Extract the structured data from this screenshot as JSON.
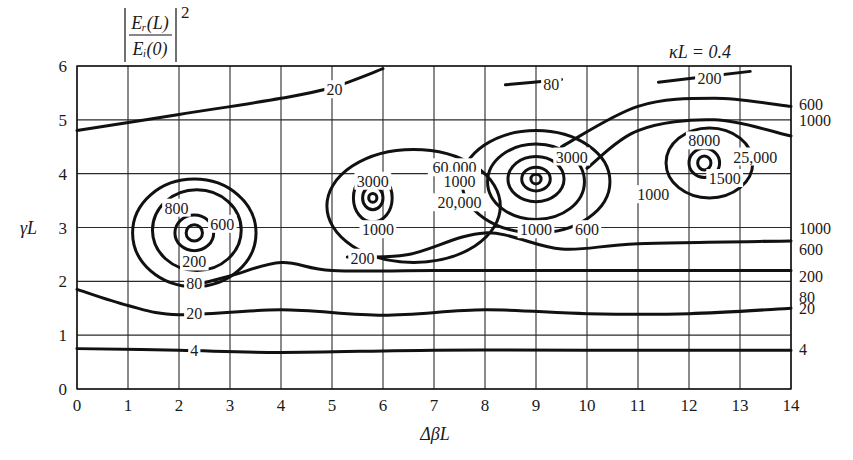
{
  "chart_data": {
    "type": "contour",
    "subtitle": "κL = 0.4",
    "xlabel": "ΔβL",
    "ylabel": "γL",
    "xlim": [
      0,
      14
    ],
    "ylim": [
      0,
      6
    ],
    "xticks": [
      0,
      1,
      2,
      3,
      4,
      5,
      6,
      7,
      8,
      9,
      10,
      11,
      12,
      13,
      14
    ],
    "yticks": [
      0,
      1,
      2,
      3,
      4,
      5,
      6
    ],
    "grid": true,
    "contour_levels": [
      4,
      20,
      80,
      200,
      600,
      800,
      1000,
      1500,
      3000,
      8000,
      20000,
      25000,
      60000
    ],
    "peaks": [
      {
        "x": 2.3,
        "y": 2.9,
        "labels": [
          "800",
          "600",
          "200",
          "80"
        ]
      },
      {
        "x": 5.8,
        "y": 3.55,
        "labels": [
          "3000",
          "1000",
          "20,000"
        ]
      },
      {
        "x": 9.0,
        "y": 3.9,
        "labels": [
          "60,000",
          "1000",
          "3000",
          "1000",
          "600"
        ]
      },
      {
        "x": 12.3,
        "y": 4.2,
        "labels": [
          "8000",
          "25,000",
          "1500",
          "1000"
        ]
      }
    ],
    "right_edge_labels": [
      {
        "value": "600",
        "y": 5.3
      },
      {
        "value": "1000",
        "y": 5.0
      },
      {
        "value": "1000",
        "y": 3.0
      },
      {
        "value": "600",
        "y": 2.6
      },
      {
        "value": "200",
        "y": 2.1
      },
      {
        "value": "80",
        "y": 1.7
      },
      {
        "value": "20",
        "y": 1.5
      },
      {
        "value": "4",
        "y": 0.75
      }
    ],
    "contours": [
      {
        "level": "4",
        "points": [
          [
            0,
            0.75
          ],
          [
            2,
            0.72
          ],
          [
            4,
            0.68
          ],
          [
            7,
            0.72
          ],
          [
            10,
            0.72
          ],
          [
            14,
            0.72
          ]
        ]
      },
      {
        "level": "20",
        "points": [
          [
            0,
            1.85
          ],
          [
            1,
            1.55
          ],
          [
            2,
            1.38
          ],
          [
            4,
            1.47
          ],
          [
            6,
            1.37
          ],
          [
            8,
            1.47
          ],
          [
            10,
            1.4
          ],
          [
            12,
            1.4
          ],
          [
            14,
            1.5
          ]
        ]
      },
      {
        "level": "80",
        "points": [
          [
            2.2,
            1.9
          ],
          [
            3,
            2.1
          ],
          [
            4,
            2.35
          ],
          [
            5,
            2.2
          ],
          [
            7,
            2.2
          ],
          [
            10,
            2.2
          ],
          [
            14,
            2.2
          ]
        ]
      },
      {
        "level": "200",
        "points": [
          [
            5.3,
            2.45
          ],
          [
            6.5,
            2.5
          ],
          [
            8,
            2.9
          ],
          [
            9.5,
            2.6
          ],
          [
            11,
            2.7
          ],
          [
            14,
            2.75
          ]
        ]
      },
      {
        "level": "20 (top)",
        "points": [
          [
            0,
            4.8
          ],
          [
            2,
            5.1
          ],
          [
            4,
            5.4
          ],
          [
            5,
            5.6
          ],
          [
            6,
            5.95
          ]
        ]
      },
      {
        "level": "80 (top)",
        "points": [
          [
            8.4,
            5.65
          ],
          [
            9.5,
            5.75
          ]
        ]
      },
      {
        "level": "200 (top)",
        "points": [
          [
            11.4,
            5.7
          ],
          [
            13.2,
            5.9
          ]
        ]
      },
      {
        "level": "600 (right)",
        "points": [
          [
            9.5,
            4.5
          ],
          [
            11,
            5.25
          ],
          [
            12.5,
            5.4
          ],
          [
            14,
            5.25
          ]
        ]
      },
      {
        "level": "1000 (right)",
        "points": [
          [
            10,
            4.1
          ],
          [
            11,
            4.8
          ],
          [
            12.5,
            5.0
          ],
          [
            14,
            4.7
          ]
        ]
      }
    ]
  }
}
